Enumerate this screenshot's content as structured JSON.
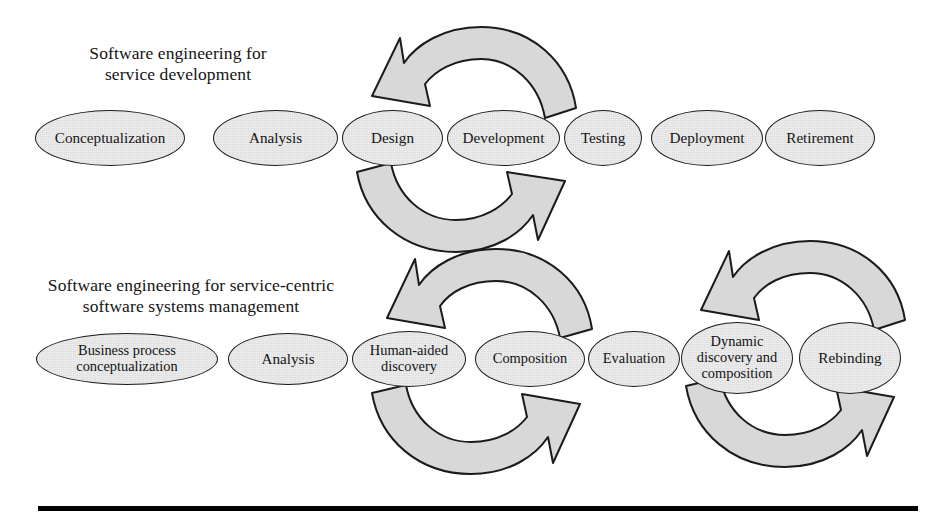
{
  "figure": {
    "type": "process-cycle-diagram",
    "background_color": "#ffffff",
    "node_fill_color": "#eeeeee",
    "node_stroke_color": "#1b1b1b",
    "arrow_fill_color": "#d8d8d8",
    "arrow_stroke_color": "#1b1b1b",
    "rule_color": "#000000"
  },
  "sections": {
    "top": {
      "title": "Software engineering for\nservice development",
      "nodes": [
        {
          "label": "Conceptualization",
          "x": 35,
          "y": 110,
          "w": 150,
          "h": 56
        },
        {
          "label": "Analysis",
          "x": 213,
          "y": 110,
          "w": 125,
          "h": 56
        },
        {
          "label": "Design",
          "x": 342,
          "y": 110,
          "w": 101,
          "h": 56
        },
        {
          "label": "Development",
          "x": 447,
          "y": 110,
          "w": 113,
          "h": 56
        },
        {
          "label": "Testing",
          "x": 564,
          "y": 110,
          "w": 78,
          "h": 56
        },
        {
          "label": "Deployment",
          "x": 651,
          "y": 110,
          "w": 112,
          "h": 56
        },
        {
          "label": "Retirement",
          "x": 765,
          "y": 110,
          "w": 110,
          "h": 56
        }
      ],
      "cycle": {
        "name": "development-testing-cycle",
        "covers": [
          "Design",
          "Development",
          "Testing"
        ],
        "direction": "counter-clockwise"
      }
    },
    "bottom": {
      "title": "Software engineering for service-centric\nsoftware systems management",
      "nodes": [
        {
          "label": "Business process\nconceptualization",
          "x": 36,
          "y": 333,
          "w": 182,
          "h": 52
        },
        {
          "label": "Analysis",
          "x": 228,
          "y": 333,
          "w": 120,
          "h": 52
        },
        {
          "label": "Human-aided\ndiscovery",
          "x": 352,
          "y": 331,
          "w": 114,
          "h": 56
        },
        {
          "label": "Composition",
          "x": 475,
          "y": 331,
          "w": 110,
          "h": 56
        },
        {
          "label": "Evaluation",
          "x": 588,
          "y": 331,
          "w": 92,
          "h": 56
        },
        {
          "label": "Dynamic\ndiscovery and\ncomposition",
          "x": 681,
          "y": 322,
          "w": 112,
          "h": 72
        },
        {
          "label": "Rebinding",
          "x": 799,
          "y": 322,
          "w": 102,
          "h": 72
        }
      ],
      "cycles": [
        {
          "name": "discovery-composition-evaluation-cycle",
          "covers": [
            "Human-aided discovery",
            "Composition",
            "Evaluation"
          ],
          "direction": "counter-clockwise"
        },
        {
          "name": "dynamic-rebinding-cycle",
          "covers": [
            "Dynamic discovery and composition",
            "Rebinding"
          ],
          "direction": "counter-clockwise"
        }
      ]
    }
  }
}
